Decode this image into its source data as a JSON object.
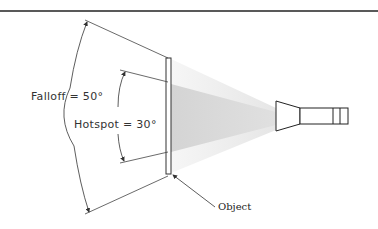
{
  "diagram": {
    "falloff_label": "Falloff = 50°",
    "hotspot_label": "Hotspot = 30°",
    "object_label": "Object",
    "falloff_angle_deg": 50,
    "hotspot_angle_deg": 30,
    "colors": {
      "line": "#333333",
      "falloff_cone": "#eeeeee",
      "hotspot_cone": "#d9d9d9",
      "top_rule": "#222222"
    }
  }
}
